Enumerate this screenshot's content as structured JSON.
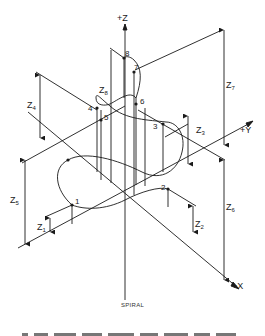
{
  "diagram": {
    "caption": "SPIRAL",
    "axes": {
      "z": "+Z",
      "y": "+Y",
      "x": "+X"
    },
    "points": [
      "1",
      "2",
      "3",
      "4",
      "5",
      "6",
      "7",
      "8"
    ],
    "heights": {
      "z1": "Z",
      "z1_sub": "1",
      "z2": "Z",
      "z2_sub": "2",
      "z3": "Z",
      "z3_sub": "3",
      "z4": "Z",
      "z4_sub": "4",
      "z5": "Z",
      "z5_sub": "5",
      "z6": "Z",
      "z6_sub": "6",
      "z7": "Z",
      "z7_sub": "7",
      "z8": "Z",
      "z8_sub": "8"
    },
    "line_color": "#1a1a1a"
  }
}
